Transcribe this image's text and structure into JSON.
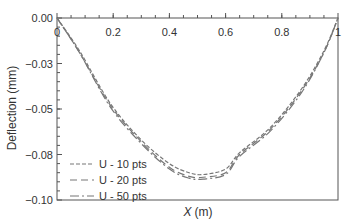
{
  "chart_data": {
    "type": "line",
    "title": "",
    "xlabel": "X (m)",
    "xlabel_italic_part": "X",
    "xlabel_unit": "(m)",
    "ylabel": "Deflection (mm)",
    "xlim": [
      0,
      1
    ],
    "ylim": [
      -0.1,
      0.0
    ],
    "xticks": [
      0,
      0.2,
      0.4,
      0.6,
      0.8,
      1
    ],
    "xtick_labels": [
      "0",
      "0.2",
      "0.4",
      "0.6",
      "0.8",
      "1"
    ],
    "yticks": [
      0.0,
      -0.025,
      -0.05,
      -0.075,
      -0.1
    ],
    "ytick_labels": [
      "0.00",
      "-0.03",
      "-0.05",
      "-0.08",
      "-0.10"
    ],
    "grid": false,
    "legend_position": "lower left",
    "series": [
      {
        "name": "U - 10 pts",
        "style": "short-dash",
        "color": "#777777",
        "x": [
          0,
          0.08,
          0.19,
          0.3,
          0.4,
          0.47,
          0.52,
          0.6,
          0.65,
          0.76,
          0.87,
          0.95,
          1
        ],
        "y": [
          0,
          -0.018,
          -0.047,
          -0.067,
          -0.08,
          -0.085,
          -0.086,
          -0.083,
          -0.074,
          -0.06,
          -0.039,
          -0.018,
          0
        ]
      },
      {
        "name": "U - 20 pts",
        "style": "long-dash",
        "color": "#777777",
        "x": [
          0,
          0.08,
          0.19,
          0.3,
          0.4,
          0.47,
          0.52,
          0.6,
          0.65,
          0.76,
          0.87,
          0.95,
          1
        ],
        "y": [
          0,
          -0.019,
          -0.048,
          -0.068,
          -0.082,
          -0.087,
          -0.0875,
          -0.085,
          -0.075,
          -0.061,
          -0.04,
          -0.019,
          0
        ]
      },
      {
        "name": "U - 50 pts",
        "style": "dash-dot",
        "color": "#777777",
        "x": [
          0,
          0.08,
          0.19,
          0.3,
          0.4,
          0.47,
          0.52,
          0.6,
          0.65,
          0.76,
          0.87,
          0.95,
          1
        ],
        "y": [
          0,
          -0.019,
          -0.049,
          -0.069,
          -0.083,
          -0.088,
          -0.0885,
          -0.086,
          -0.076,
          -0.062,
          -0.041,
          -0.019,
          0
        ]
      }
    ]
  },
  "colors": {
    "axis": "#555555",
    "text": "#333333",
    "series": "#777777"
  }
}
